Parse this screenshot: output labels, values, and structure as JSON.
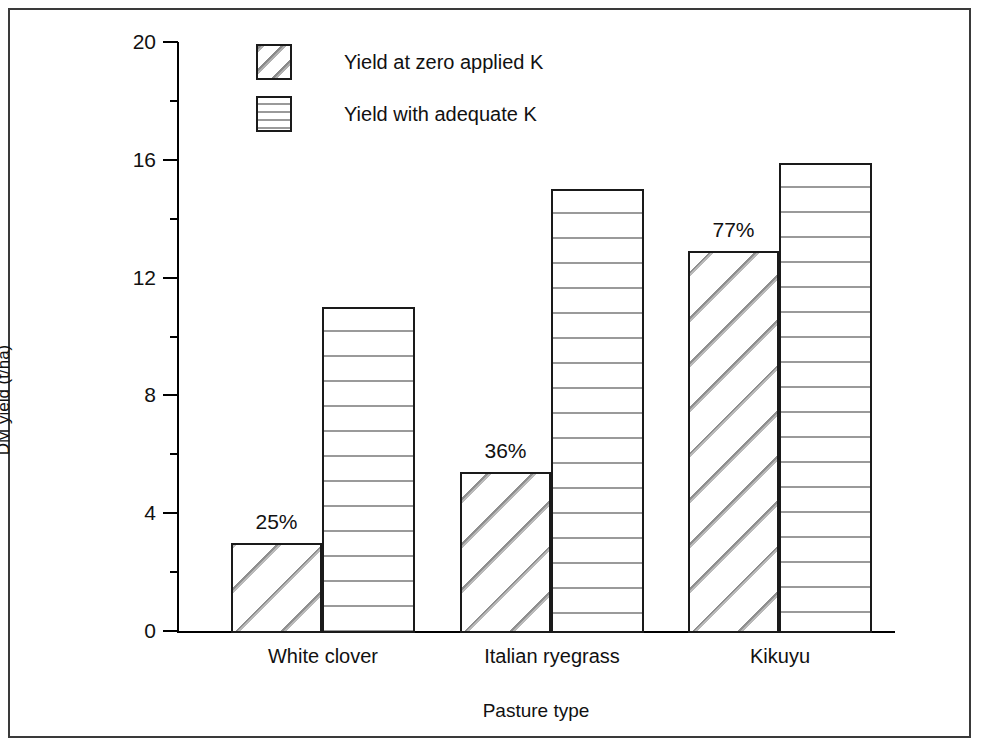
{
  "chart_data": {
    "type": "bar",
    "title": "",
    "xlabel": "Pasture type",
    "ylabel": "DM yield (t/ha)",
    "categories": [
      "White clover",
      "Italian ryegrass",
      "Kikuyu"
    ],
    "series": [
      {
        "name": "Yield at zero applied K",
        "pattern": "diagonal-hatch",
        "values": [
          3.0,
          5.4,
          12.9
        ]
      },
      {
        "name": "Yield with adequate K",
        "pattern": "horizontal-dots",
        "values": [
          11.0,
          15.0,
          15.9
        ]
      }
    ],
    "annotations": [
      "25%",
      "36%",
      "77%"
    ],
    "ylim": [
      0,
      20
    ],
    "yticks": [
      0,
      4,
      8,
      12,
      16,
      20
    ],
    "ytick_labels": [
      "0",
      "4",
      "8",
      "12",
      "16",
      "20"
    ],
    "grid": false,
    "legend_position": "top-center"
  },
  "axis": {
    "y_title": "DM yield (t/ha)",
    "x_title": "Pasture type",
    "ticks": [
      {
        "label": "20",
        "value": 20
      },
      {
        "label": "16",
        "value": 16
      },
      {
        "label": "12",
        "value": 12
      },
      {
        "label": "8",
        "value": 8
      },
      {
        "label": "4",
        "value": 4
      },
      {
        "label": "0",
        "value": 0
      }
    ]
  },
  "categories": [
    {
      "label": "White clover"
    },
    {
      "label": "Italian ryegrass"
    },
    {
      "label": "Kikuyu"
    }
  ],
  "legend": {
    "items": [
      {
        "label": "Yield at zero applied K",
        "pattern": "diagonal-hatch"
      },
      {
        "label": "Yield with adequate K",
        "pattern": "horizontal-dots"
      }
    ]
  },
  "bars": [
    {
      "category": "White clover",
      "series": "Yield at zero applied K",
      "value": 3.0,
      "label": "3.0"
    },
    {
      "category": "White clover",
      "series": "Yield with adequate K",
      "value": 11.0,
      "label": "11.0"
    },
    {
      "category": "Italian ryegrass",
      "series": "Yield at zero applied K",
      "value": 5.4,
      "label": "5.4"
    },
    {
      "category": "Italian ryegrass",
      "series": "Yield with adequate K",
      "value": 15.0,
      "label": "15.0"
    },
    {
      "category": "Kikuyu",
      "series": "Yield at zero applied K",
      "value": 12.9,
      "label": "12.9"
    },
    {
      "category": "Kikuyu",
      "series": "Yield with adequate K",
      "value": 15.9,
      "label": "15.9"
    }
  ],
  "annotations": [
    {
      "text": "25%",
      "category": "White clover"
    },
    {
      "text": "36%",
      "category": "Italian ryegrass"
    },
    {
      "text": "77%",
      "category": "Kikuyu"
    }
  ],
  "colors": {
    "axis": "#000000",
    "bar_outline": "#1a1a1a",
    "bar_fill": "#ffffff",
    "hatch": "#8f8f8f",
    "dots": "#9a9a9a",
    "frame": "#3a3a3a",
    "text": "#111111",
    "background": "#ffffff"
  }
}
